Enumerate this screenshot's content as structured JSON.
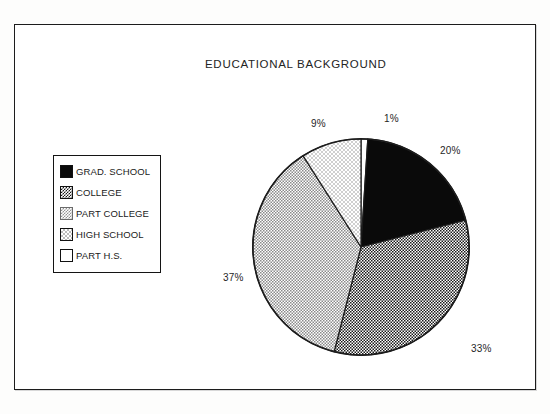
{
  "chart": {
    "title": "EDUCATIONAL BACKGROUND"
  },
  "legend": {
    "items": [
      {
        "label": "GRAD. SCHOOL",
        "pattern": "solid-black",
        "swatch_name": "legend-swatch-grad-school"
      },
      {
        "label": "COLLEGE",
        "pattern": "dense-checker",
        "swatch_name": "legend-swatch-college"
      },
      {
        "label": "PART COLLEGE",
        "pattern": "light-dots",
        "swatch_name": "legend-swatch-part-college"
      },
      {
        "label": "HIGH SCHOOL",
        "pattern": "faint-dots",
        "swatch_name": "legend-swatch-high-school"
      },
      {
        "label": "PART H.S.",
        "pattern": "white",
        "swatch_name": "legend-swatch-part-hs"
      }
    ]
  },
  "labels": {
    "part_hs": "1%",
    "grad_school": "20%",
    "college": "33%",
    "part_college": "37%",
    "high_school": "9%"
  },
  "colors": {
    "outline": "#1c1c1c",
    "solid_slice": "#0a0a0a",
    "background": "#ffffff",
    "text": "#1f1f1f"
  },
  "chart_data": {
    "type": "pie",
    "title": "EDUCATIONAL BACKGROUND",
    "xlabel": "",
    "ylabel": "",
    "legend_position": "left",
    "grid": false,
    "start_angle_deg": 0,
    "direction": "clockwise",
    "categories": [
      "PART H.S.",
      "GRAD. SCHOOL",
      "COLLEGE",
      "PART COLLEGE",
      "HIGH SCHOOL"
    ],
    "values": [
      1,
      20,
      33,
      37,
      9
    ],
    "labels": [
      "1%",
      "20%",
      "33%",
      "37%",
      "9%"
    ],
    "slices": [
      {
        "name": "PART H.S.",
        "value": 1,
        "label": "1%",
        "fill": "white",
        "start_deg": 0,
        "end_deg": 3.6
      },
      {
        "name": "GRAD. SCHOOL",
        "value": 20,
        "label": "20%",
        "fill": "solid-black",
        "start_deg": 3.6,
        "end_deg": 75.6
      },
      {
        "name": "COLLEGE",
        "value": 33,
        "label": "33%",
        "fill": "dense-checker",
        "start_deg": 75.6,
        "end_deg": 194.4
      },
      {
        "name": "PART COLLEGE",
        "value": 37,
        "label": "37%",
        "fill": "light-dots",
        "start_deg": 194.4,
        "end_deg": 327.6
      },
      {
        "name": "HIGH SCHOOL",
        "value": 9,
        "label": "9%",
        "fill": "faint-dots",
        "start_deg": 327.6,
        "end_deg": 360
      }
    ]
  }
}
